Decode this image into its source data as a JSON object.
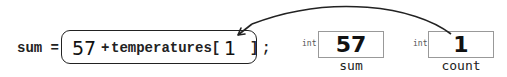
{
  "statement": {
    "lhs": "sum =",
    "expression": {
      "literal": "57",
      "operator": "+",
      "array_name": "temperatures[",
      "index_value": "1",
      "close_bracket": "]"
    },
    "terminator": ";"
  },
  "variables": [
    {
      "type": "int",
      "value": "57",
      "name": "sum"
    },
    {
      "type": "int",
      "value": "1",
      "name": "count"
    }
  ],
  "arrow": {
    "from": "count",
    "to": "index_value",
    "color": "#222222"
  }
}
